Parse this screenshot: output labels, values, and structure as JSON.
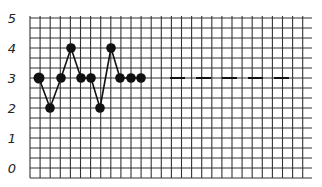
{
  "chart_data": {
    "type": "line",
    "title": "",
    "xlabel": "",
    "ylabel": "",
    "ylim": [
      0,
      5
    ],
    "yticks": [
      "0",
      "1",
      "2",
      "3",
      "4",
      "5"
    ],
    "grid": true,
    "legend": null,
    "x": [
      1,
      2,
      3,
      4,
      5,
      6,
      7,
      8,
      9,
      10,
      11
    ],
    "series": [
      {
        "name": "data",
        "values": [
          3,
          2,
          3,
          4,
          3,
          3,
          2,
          4,
          3,
          3,
          3
        ],
        "style": "solid line with filled circle markers"
      }
    ],
    "annotations": [
      {
        "type": "dashed-line",
        "y": 3,
        "description": "dashed horizontal continuation at level 3 to the right of the data"
      }
    ]
  },
  "colors": {
    "ink": "#111111",
    "grid": "#333333",
    "background": "#ffffff"
  }
}
